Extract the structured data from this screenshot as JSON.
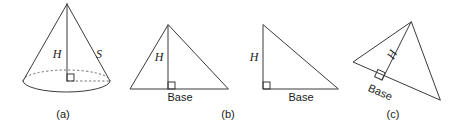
{
  "figure": {
    "background_color": "#ffffff",
    "line_color": "#3a3a3a",
    "dashed_line_color": "#6e6e6e",
    "text_color": "#1a1a1a",
    "panels": [
      {
        "id": "a",
        "caption": "(a)",
        "shape": "cone",
        "labels": {
          "height": "H",
          "slant": "S"
        },
        "has_right_angle_mark": true,
        "has_hidden_base_edge": true
      },
      {
        "id": "b",
        "caption": "(b)",
        "shape": "acute-triangle",
        "labels": {
          "height": "H",
          "base": "Base"
        },
        "has_right_angle_mark": true
      },
      {
        "id": "b2",
        "caption": "",
        "shape": "right-triangle",
        "labels": {
          "height": "H",
          "base": "Base"
        },
        "has_right_angle_mark": true
      },
      {
        "id": "c",
        "caption": "(c)",
        "shape": "oblique-triangle",
        "labels": {
          "height": "H",
          "base": "Base"
        },
        "has_right_angle_mark": true
      }
    ]
  }
}
